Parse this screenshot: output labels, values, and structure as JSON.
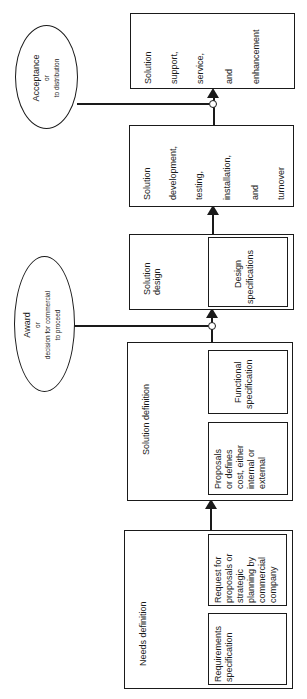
{
  "diagram": {
    "orientation": "rotated 90deg counterclockwise; flow runs bottom to top",
    "phases": [
      {
        "id": "needs",
        "label": "Needs definition",
        "sub_boxes": [
          {
            "label": "Request for proposals or strategic planning by commercial company",
            "lines": [
              "Request for",
              "proposals or",
              "strategic",
              "planning by",
              "commercial",
              "company"
            ]
          },
          {
            "label": "Requirements specification",
            "lines": [
              "Requirements",
              "specification"
            ]
          }
        ]
      },
      {
        "id": "solution-definition",
        "label": "Solution definition",
        "sub_boxes": [
          {
            "label": "Functional specification",
            "lines": [
              "Functional",
              "specification"
            ]
          },
          {
            "label": "Proposals or defines cost, either internal or external",
            "lines": [
              "Proposals",
              "or defines",
              "cost, either",
              "internal or",
              "external"
            ]
          }
        ]
      },
      {
        "id": "solution-design",
        "label": "Solution design",
        "lines": [
          "Solution",
          "design"
        ],
        "sub_boxes": [
          {
            "label": "Design specifications",
            "lines": [
              "Design",
              "specifications"
            ]
          }
        ]
      },
      {
        "id": "solution-development",
        "label": "Solution development, testing, installation, and turnover",
        "lines": [
          "Solution",
          "development,",
          "testing,",
          "installation,",
          "and",
          "turnover"
        ]
      },
      {
        "id": "solution-support",
        "label": "Solution support, service, and enhancement",
        "lines": [
          "Solution",
          "support,",
          "service,",
          "and",
          "enhancement"
        ]
      }
    ],
    "decision_points": [
      {
        "id": "award",
        "title": "Award",
        "connector": "or",
        "lines": [
          "decision for commercial",
          "to proceed"
        ],
        "between": [
          "solution-definition",
          "solution-design"
        ]
      },
      {
        "id": "acceptance",
        "title": "Acceptance",
        "connector": "or",
        "lines": [
          "to distribution"
        ],
        "between": [
          "solution-development",
          "solution-support"
        ]
      }
    ],
    "edges": [
      {
        "from": "needs",
        "to": "solution-definition"
      },
      {
        "from": "solution-definition",
        "to": "solution-design"
      },
      {
        "from": "solution-design",
        "to": "solution-development"
      },
      {
        "from": "solution-development",
        "to": "solution-support"
      }
    ]
  }
}
